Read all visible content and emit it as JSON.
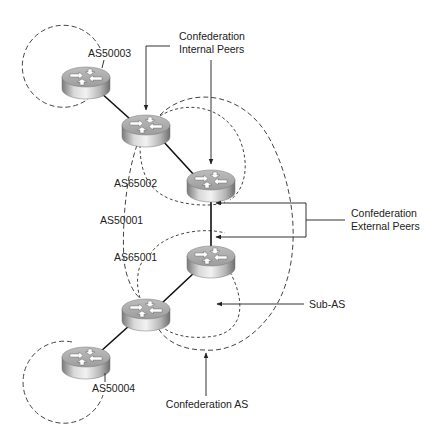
{
  "diagram": {
    "type": "BGP confederation topology",
    "labels": {
      "as50003": "AS50003",
      "as50004": "AS50004",
      "as65002": "AS65002",
      "as65001": "AS65001",
      "as50001": "AS50001",
      "internal_peers_line1": "Confederation",
      "internal_peers_line2": "Internal Peers",
      "external_peers_line1": "Confederation",
      "external_peers_line2": "External Peers",
      "sub_as": "Sub-AS",
      "confederation_as": "Confederation AS"
    },
    "routers": [
      {
        "id": "r1",
        "as": "AS50003",
        "x": 86,
        "y": 81
      },
      {
        "id": "r2",
        "as": "AS65002",
        "x": 146,
        "y": 129
      },
      {
        "id": "r3",
        "as": "AS65002",
        "x": 211,
        "y": 184
      },
      {
        "id": "r4",
        "as": "AS65001",
        "x": 211,
        "y": 260
      },
      {
        "id": "r5",
        "as": "AS65001",
        "x": 146,
        "y": 313
      },
      {
        "id": "r6",
        "as": "AS50004",
        "x": 86,
        "y": 361
      }
    ],
    "links": [
      [
        "r1",
        "r2"
      ],
      [
        "r2",
        "r3"
      ],
      [
        "r3",
        "r4"
      ],
      [
        "r4",
        "r5"
      ],
      [
        "r5",
        "r6"
      ]
    ],
    "colors": {
      "line": "#111111",
      "dash": "#444444",
      "text": "#222222",
      "router_top": "#d8d8d8",
      "router_side_dark": "#8a8a8a"
    }
  }
}
